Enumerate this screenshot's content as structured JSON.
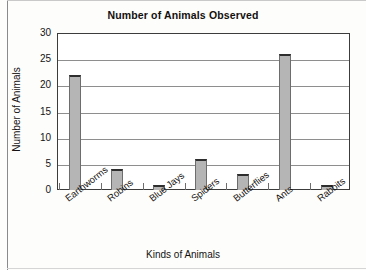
{
  "chart_data": {
    "type": "bar",
    "title": "Number of Animals Observed",
    "xlabel": "Kinds of Animals",
    "ylabel": "Number of Animals",
    "categories": [
      "Earthworms",
      "Robins",
      "Blue Jays",
      "Spiders",
      "Butterflies",
      "Ants",
      "Rabbits"
    ],
    "values": [
      22,
      4,
      1,
      6,
      3,
      26,
      1
    ],
    "ylim": [
      0,
      30
    ],
    "yticks": [
      0,
      5,
      10,
      15,
      20,
      25,
      30
    ],
    "ytick_labels": [
      "0",
      "5",
      "10",
      "15",
      "20",
      "25",
      "30"
    ],
    "grid": true,
    "legend": null,
    "bar_color": "#b5b5b5",
    "bar_edge_color": "#6d6d6d",
    "bar_top_color": "#2e2e2e",
    "gridline_color": "#8e8e8e",
    "axis_color": "#3c3c3c",
    "background_color": "#ffffff"
  }
}
